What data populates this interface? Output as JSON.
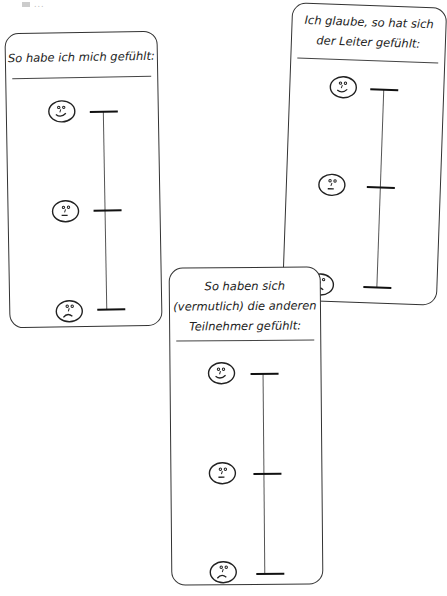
{
  "top_note": "...",
  "cards": [
    {
      "title_lines": [
        "So habe ich mich gefühlt:"
      ],
      "scale": [
        {
          "level": "happy",
          "icon": "happy-face-icon"
        },
        {
          "level": "neutral",
          "icon": "neutral-face-icon"
        },
        {
          "level": "sad",
          "icon": "sad-face-icon"
        }
      ]
    },
    {
      "title_lines": [
        "Ich glaube, so hat sich",
        "der Leiter gefühlt:"
      ],
      "scale": [
        {
          "level": "happy",
          "icon": "happy-face-icon"
        },
        {
          "level": "neutral",
          "icon": "neutral-face-icon"
        },
        {
          "level": "sad",
          "icon": "sad-face-icon"
        }
      ]
    },
    {
      "title_lines": [
        "So haben sich",
        "(vermutlich) die anderen",
        "Teilnehmer gefühlt:"
      ],
      "scale": [
        {
          "level": "happy",
          "icon": "happy-face-icon"
        },
        {
          "level": "neutral",
          "icon": "neutral-face-icon"
        },
        {
          "level": "sad",
          "icon": "sad-face-icon"
        }
      ]
    }
  ],
  "colors": {
    "stroke": "#222222",
    "background": "#ffffff"
  }
}
